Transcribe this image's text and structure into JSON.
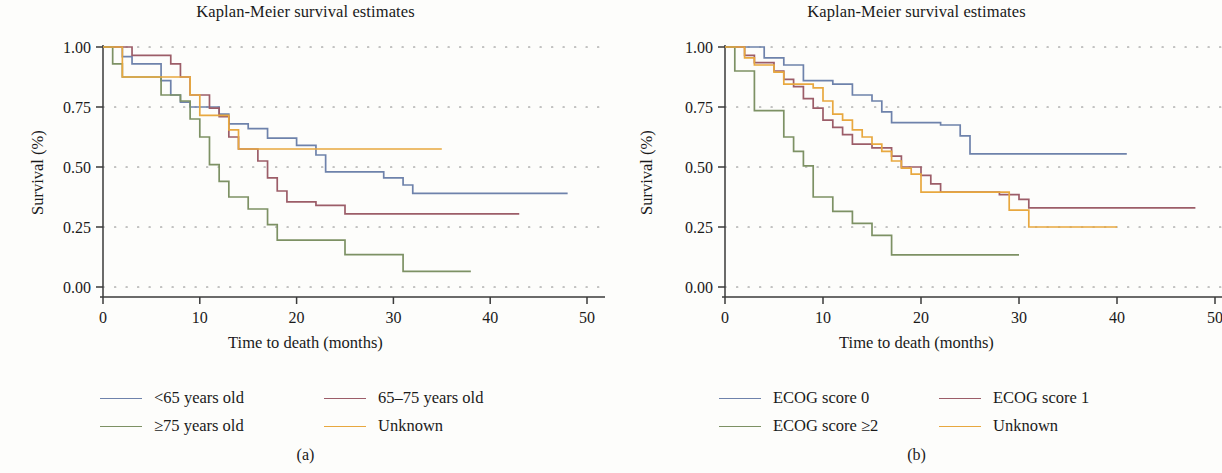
{
  "figure": {
    "panels": [
      {
        "id": "a",
        "subcaption": "(a)",
        "title": "Kaplan-Meier survival estimates",
        "xlabel": "Time to death (months)",
        "ylabel": "Survival (%)",
        "xticks": [
          "0",
          "10",
          "20",
          "30",
          "40",
          "50"
        ],
        "yticks": [
          "0.00",
          "0.25",
          "0.50",
          "0.75",
          "1.00"
        ],
        "legend": [
          {
            "label": "<65 years old",
            "color": "#6E82AB"
          },
          {
            "label": "65–75 years old",
            "color": "#9C5D68"
          },
          {
            "label": "≥75 years old",
            "color": "#7D9164"
          },
          {
            "label": "Unknown",
            "color": "#E8A83F"
          }
        ]
      },
      {
        "id": "b",
        "subcaption": "(b)",
        "title": "Kaplan-Meier survival estimates",
        "xlabel": "Time to death (months)",
        "ylabel": "Survival (%)",
        "xticks": [
          "0",
          "10",
          "20",
          "30",
          "40",
          "50"
        ],
        "yticks": [
          "0.00",
          "0.25",
          "0.50",
          "0.75",
          "1.00"
        ],
        "legend": [
          {
            "label": "ECOG score 0",
            "color": "#6E82AB"
          },
          {
            "label": "ECOG score 1",
            "color": "#9C5D68"
          },
          {
            "label": "ECOG score ≥2",
            "color": "#7D9164"
          },
          {
            "label": "Unknown",
            "color": "#E8A83F"
          }
        ]
      }
    ]
  },
  "chart_data": [
    {
      "type": "line",
      "panel": "a",
      "title": "Kaplan-Meier survival estimates",
      "xlabel": "Time to death (months)",
      "ylabel": "Survival (%)",
      "xlim": [
        0,
        50
      ],
      "ylim": [
        0,
        1
      ],
      "xticks": [
        0,
        10,
        20,
        30,
        40,
        50
      ],
      "yticks": [
        0.0,
        0.25,
        0.5,
        0.75,
        1.0
      ],
      "grid": "dotted-horizontal",
      "legend_position": "below",
      "step": "post",
      "series": [
        {
          "name": "<65 years old",
          "color": "#6E82AB",
          "points": [
            [
              0,
              1.0
            ],
            [
              2,
              1.0
            ],
            [
              2,
              0.96
            ],
            [
              3,
              0.96
            ],
            [
              3,
              0.93
            ],
            [
              6,
              0.93
            ],
            [
              6,
              0.86
            ],
            [
              7,
              0.86
            ],
            [
              7,
              0.8
            ],
            [
              8,
              0.8
            ],
            [
              8,
              0.77
            ],
            [
              9,
              0.77
            ],
            [
              9,
              0.75
            ],
            [
              12,
              0.75
            ],
            [
              12,
              0.72
            ],
            [
              13,
              0.72
            ],
            [
              13,
              0.68
            ],
            [
              15,
              0.68
            ],
            [
              15,
              0.66
            ],
            [
              17,
              0.66
            ],
            [
              17,
              0.62
            ],
            [
              20,
              0.62
            ],
            [
              20,
              0.59
            ],
            [
              22,
              0.59
            ],
            [
              22,
              0.55
            ],
            [
              23,
              0.55
            ],
            [
              23,
              0.48
            ],
            [
              29,
              0.48
            ],
            [
              29,
              0.455
            ],
            [
              31,
              0.455
            ],
            [
              31,
              0.425
            ],
            [
              32,
              0.425
            ],
            [
              32,
              0.39
            ],
            [
              48,
              0.39
            ]
          ]
        },
        {
          "name": "65–75 years old",
          "color": "#9C5D68",
          "points": [
            [
              0,
              1.0
            ],
            [
              3,
              1.0
            ],
            [
              3,
              0.965
            ],
            [
              7,
              0.965
            ],
            [
              7,
              0.93
            ],
            [
              8,
              0.93
            ],
            [
              8,
              0.875
            ],
            [
              9,
              0.875
            ],
            [
              9,
              0.8
            ],
            [
              11,
              0.8
            ],
            [
              11,
              0.745
            ],
            [
              12,
              0.745
            ],
            [
              12,
              0.71
            ],
            [
              13,
              0.71
            ],
            [
              13,
              0.625
            ],
            [
              14,
              0.625
            ],
            [
              14,
              0.575
            ],
            [
              16,
              0.575
            ],
            [
              16,
              0.525
            ],
            [
              17,
              0.525
            ],
            [
              17,
              0.455
            ],
            [
              18,
              0.455
            ],
            [
              18,
              0.4
            ],
            [
              19,
              0.4
            ],
            [
              19,
              0.355
            ],
            [
              22,
              0.355
            ],
            [
              22,
              0.34
            ],
            [
              25,
              0.34
            ],
            [
              25,
              0.305
            ],
            [
              43,
              0.305
            ]
          ]
        },
        {
          "name": "≥75 years old",
          "color": "#7D9164",
          "points": [
            [
              0,
              1.0
            ],
            [
              1,
              1.0
            ],
            [
              1,
              0.93
            ],
            [
              2,
              0.93
            ],
            [
              2,
              0.875
            ],
            [
              6,
              0.875
            ],
            [
              6,
              0.8
            ],
            [
              8,
              0.8
            ],
            [
              8,
              0.775
            ],
            [
              9,
              0.775
            ],
            [
              9,
              0.7
            ],
            [
              10,
              0.7
            ],
            [
              10,
              0.625
            ],
            [
              11,
              0.625
            ],
            [
              11,
              0.51
            ],
            [
              12,
              0.51
            ],
            [
              12,
              0.44
            ],
            [
              13,
              0.44
            ],
            [
              13,
              0.375
            ],
            [
              15,
              0.375
            ],
            [
              15,
              0.325
            ],
            [
              17,
              0.325
            ],
            [
              17,
              0.26
            ],
            [
              18,
              0.26
            ],
            [
              18,
              0.195
            ],
            [
              25,
              0.195
            ],
            [
              25,
              0.135
            ],
            [
              31,
              0.135
            ],
            [
              31,
              0.065
            ],
            [
              38,
              0.065
            ]
          ]
        },
        {
          "name": "Unknown",
          "color": "#E8A83F",
          "points": [
            [
              0,
              1.0
            ],
            [
              2,
              1.0
            ],
            [
              2,
              0.875
            ],
            [
              9,
              0.875
            ],
            [
              9,
              0.8
            ],
            [
              10,
              0.8
            ],
            [
              10,
              0.715
            ],
            [
              13,
              0.715
            ],
            [
              13,
              0.655
            ],
            [
              14,
              0.655
            ],
            [
              14,
              0.575
            ],
            [
              35,
              0.575
            ]
          ]
        }
      ]
    },
    {
      "type": "line",
      "panel": "b",
      "title": "Kaplan-Meier survival estimates",
      "xlabel": "Time to death (months)",
      "ylabel": "Survival (%)",
      "xlim": [
        0,
        50
      ],
      "ylim": [
        0,
        1
      ],
      "xticks": [
        0,
        10,
        20,
        30,
        40,
        50
      ],
      "yticks": [
        0.0,
        0.25,
        0.5,
        0.75,
        1.0
      ],
      "grid": "dotted-horizontal",
      "legend_position": "below",
      "step": "post",
      "series": [
        {
          "name": "ECOG score 0",
          "color": "#6E82AB",
          "points": [
            [
              0,
              1.0
            ],
            [
              4,
              1.0
            ],
            [
              4,
              0.955
            ],
            [
              6,
              0.955
            ],
            [
              6,
              0.925
            ],
            [
              8,
              0.925
            ],
            [
              8,
              0.86
            ],
            [
              11,
              0.86
            ],
            [
              11,
              0.845
            ],
            [
              13,
              0.845
            ],
            [
              13,
              0.8
            ],
            [
              15,
              0.8
            ],
            [
              15,
              0.775
            ],
            [
              16,
              0.775
            ],
            [
              16,
              0.73
            ],
            [
              17,
              0.73
            ],
            [
              17,
              0.685
            ],
            [
              22,
              0.685
            ],
            [
              22,
              0.675
            ],
            [
              24,
              0.675
            ],
            [
              24,
              0.63
            ],
            [
              25,
              0.63
            ],
            [
              25,
              0.555
            ],
            [
              41,
              0.555
            ]
          ]
        },
        {
          "name": "ECOG score 1",
          "color": "#9C5D68",
          "points": [
            [
              0,
              1.0
            ],
            [
              2,
              1.0
            ],
            [
              2,
              0.965
            ],
            [
              3,
              0.965
            ],
            [
              3,
              0.935
            ],
            [
              5,
              0.935
            ],
            [
              5,
              0.9
            ],
            [
              6,
              0.9
            ],
            [
              6,
              0.865
            ],
            [
              7,
              0.865
            ],
            [
              7,
              0.835
            ],
            [
              8,
              0.835
            ],
            [
              8,
              0.785
            ],
            [
              9,
              0.785
            ],
            [
              9,
              0.745
            ],
            [
              10,
              0.745
            ],
            [
              10,
              0.695
            ],
            [
              11,
              0.695
            ],
            [
              11,
              0.665
            ],
            [
              12,
              0.665
            ],
            [
              12,
              0.635
            ],
            [
              13,
              0.635
            ],
            [
              13,
              0.595
            ],
            [
              15,
              0.595
            ],
            [
              15,
              0.58
            ],
            [
              17,
              0.58
            ],
            [
              17,
              0.545
            ],
            [
              18,
              0.545
            ],
            [
              18,
              0.5
            ],
            [
              20,
              0.5
            ],
            [
              20,
              0.465
            ],
            [
              21,
              0.465
            ],
            [
              21,
              0.43
            ],
            [
              22,
              0.43
            ],
            [
              22,
              0.395
            ],
            [
              28,
              0.395
            ],
            [
              28,
              0.385
            ],
            [
              30,
              0.385
            ],
            [
              30,
              0.365
            ],
            [
              31,
              0.365
            ],
            [
              31,
              0.33
            ],
            [
              48,
              0.33
            ]
          ]
        },
        {
          "name": "ECOG score ≥2",
          "color": "#7D9164",
          "points": [
            [
              0,
              1.0
            ],
            [
              1,
              1.0
            ],
            [
              1,
              0.9
            ],
            [
              3,
              0.9
            ],
            [
              3,
              0.735
            ],
            [
              6,
              0.735
            ],
            [
              6,
              0.625
            ],
            [
              7,
              0.625
            ],
            [
              7,
              0.565
            ],
            [
              8,
              0.565
            ],
            [
              8,
              0.505
            ],
            [
              9,
              0.505
            ],
            [
              9,
              0.375
            ],
            [
              11,
              0.375
            ],
            [
              11,
              0.315
            ],
            [
              13,
              0.315
            ],
            [
              13,
              0.265
            ],
            [
              15,
              0.265
            ],
            [
              15,
              0.215
            ],
            [
              17,
              0.215
            ],
            [
              17,
              0.134
            ],
            [
              30,
              0.134
            ]
          ]
        },
        {
          "name": "Unknown",
          "color": "#E8A83F",
          "points": [
            [
              0,
              1.0
            ],
            [
              2,
              1.0
            ],
            [
              2,
              0.955
            ],
            [
              3,
              0.955
            ],
            [
              3,
              0.925
            ],
            [
              5,
              0.925
            ],
            [
              5,
              0.895
            ],
            [
              6,
              0.895
            ],
            [
              6,
              0.845
            ],
            [
              9,
              0.845
            ],
            [
              9,
              0.83
            ],
            [
              10,
              0.83
            ],
            [
              10,
              0.775
            ],
            [
              11,
              0.775
            ],
            [
              11,
              0.72
            ],
            [
              12,
              0.72
            ],
            [
              12,
              0.695
            ],
            [
              13,
              0.695
            ],
            [
              13,
              0.655
            ],
            [
              14,
              0.655
            ],
            [
              14,
              0.625
            ],
            [
              15,
              0.625
            ],
            [
              15,
              0.595
            ],
            [
              16,
              0.595
            ],
            [
              16,
              0.565
            ],
            [
              17,
              0.565
            ],
            [
              17,
              0.525
            ],
            [
              18,
              0.525
            ],
            [
              18,
              0.495
            ],
            [
              19,
              0.495
            ],
            [
              19,
              0.47
            ],
            [
              20,
              0.47
            ],
            [
              20,
              0.395
            ],
            [
              29,
              0.395
            ],
            [
              29,
              0.32
            ],
            [
              31,
              0.32
            ],
            [
              31,
              0.25
            ],
            [
              40,
              0.25
            ]
          ]
        }
      ]
    }
  ]
}
